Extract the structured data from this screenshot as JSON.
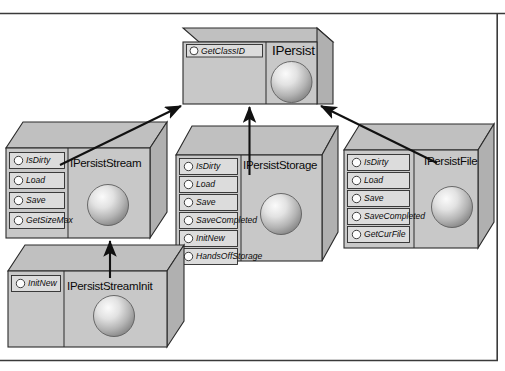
{
  "diagram": {
    "title_text": "",
    "type": "COM interface inheritance diagram",
    "colors": {
      "background": "#ffffff",
      "box_front": "#c8c8c8",
      "box_top": "#bdbdbd",
      "box_side": "#b0b0b0",
      "row_fill": "#dcdcdc",
      "outline": "#2b2b2b",
      "arrow": "#111111",
      "border": "#3a3a3a",
      "sphere_light": "#f2f2f2",
      "sphere_dark": "#8e8e8e"
    },
    "frame": {
      "top_rule": true,
      "bottom_rule": true,
      "right_rule": true
    },
    "nodes": [
      {
        "id": "ipersist",
        "name": "IPersist",
        "methods": [
          "GetClassID"
        ]
      },
      {
        "id": "ipersiststream",
        "name": "IPersistStream",
        "methods": [
          "IsDirty",
          "Load",
          "Save",
          "GetSizeMax"
        ]
      },
      {
        "id": "ipersiststorage",
        "name": "IPersistStorage",
        "methods": [
          "IsDirty",
          "Load",
          "Save",
          "SaveCompleted",
          "InitNew",
          "HandsOffStorage"
        ]
      },
      {
        "id": "ipersistfile",
        "name": "IPersistFile",
        "methods": [
          "IsDirty",
          "Load",
          "Save",
          "SaveCompleted",
          "GetCurFile"
        ]
      },
      {
        "id": "ipersiststreaminit",
        "name": "IPersistStreamInit",
        "methods": [
          "InitNew"
        ]
      }
    ],
    "edges": [
      {
        "from": "ipersiststream",
        "to": "ipersist",
        "style": "inheritance-arrow"
      },
      {
        "from": "ipersiststorage",
        "to": "ipersist",
        "style": "inheritance-arrow"
      },
      {
        "from": "ipersistfile",
        "to": "ipersist",
        "style": "inheritance-arrow"
      },
      {
        "from": "ipersiststreaminit",
        "to": "ipersiststream",
        "style": "inheritance-arrow"
      }
    ]
  }
}
